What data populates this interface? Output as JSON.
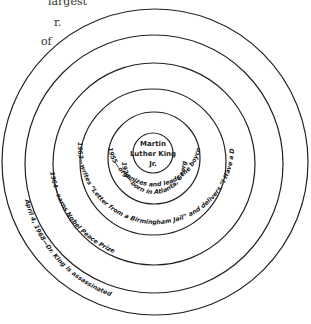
{
  "cropped_text": {
    "line1": "largest",
    "line2": "r.",
    "line3": "of"
  },
  "diagram": {
    "center": "Martin Luther King Jr.",
    "center_lines": [
      "Martin",
      "Luther King",
      "Jr."
    ],
    "rings": [
      {
        "label": "1924—born in Atlanta, Georgia"
      },
      {
        "label": "1955—organizes and leads the boycott of busses in Montgomery"
      },
      {
        "label": "1963—writes “Letter from a Birmingham Jail” and delivers “I Have a Dream” speech"
      },
      {
        "label": "1964—earns Nobel Peace Prize"
      },
      {
        "label": "April 4, 1968—Dr. King is assassinated"
      }
    ]
  }
}
